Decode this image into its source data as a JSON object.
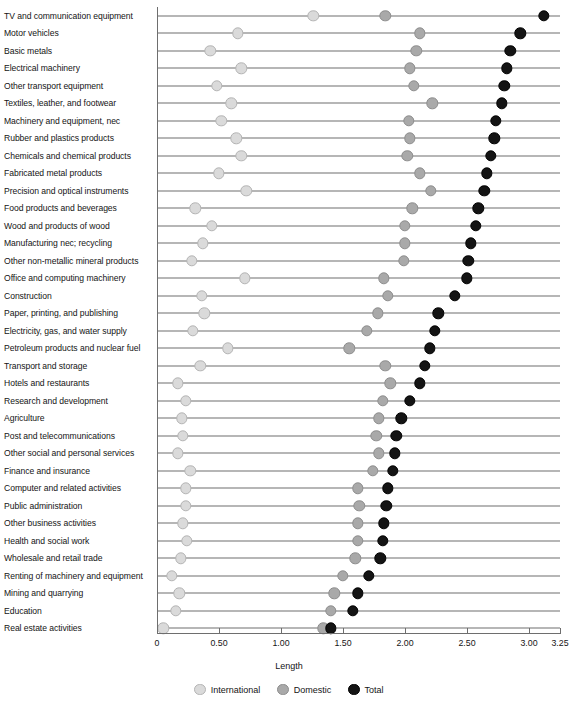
{
  "chart_data": {
    "type": "scatter",
    "title": "",
    "xlabel": "Length",
    "ylabel": "",
    "xlim": [
      0,
      3.25
    ],
    "xticks": [
      0,
      0.5,
      1.0,
      1.5,
      2.0,
      2.5,
      3.0,
      3.25
    ],
    "xtick_labels": [
      "0",
      "0.50",
      "1.00",
      "1.50",
      "2.00",
      "2.50",
      "3.00",
      "3.25"
    ],
    "grid": false,
    "legend_position": "bottom",
    "legend": [
      "International",
      "Domestic",
      "Total"
    ],
    "series_colors": {
      "International": "#dadada",
      "Domestic": "#a9a9a9",
      "Total": "#141414"
    },
    "categories": [
      "TV and communication equipment",
      "Motor vehicles",
      "Basic metals",
      "Electrical machinery",
      "Other transport equipment",
      "Textiles, leather, and footwear",
      "Machinery and equipment, nec",
      "Rubber and plastics products",
      "Chemicals and chemical products",
      "Fabricated metal products",
      "Precision and optical instruments",
      "Food products and beverages",
      "Wood and products of wood",
      "Manufacturing nec; recycling",
      "Other non-metallic mineral products",
      "Office and computing machinery",
      "Construction",
      "Paper, printing, and publishing",
      "Electricity, gas, and water supply",
      "Petroleum products and nuclear fuel",
      "Transport and storage",
      "Hotels and restaurants",
      "Research and development",
      "Agriculture",
      "Post and telecommunications",
      "Other social and personal services",
      "Finance and insurance",
      "Computer and related activities",
      "Public administration",
      "Other business activities",
      "Health and social work",
      "Wholesale and retail trade",
      "Renting of machinery and equipment",
      "Mining and quarrying",
      "Education",
      "Real estate activities"
    ],
    "series": [
      {
        "name": "International",
        "values": [
          1.26,
          0.65,
          0.43,
          0.68,
          0.48,
          0.6,
          0.52,
          0.64,
          0.68,
          0.5,
          0.72,
          0.31,
          0.44,
          0.37,
          0.28,
          0.71,
          0.36,
          0.38,
          0.29,
          0.57,
          0.35,
          0.17,
          0.23,
          0.2,
          0.21,
          0.17,
          0.27,
          0.23,
          0.23,
          0.21,
          0.24,
          0.19,
          0.12,
          0.18,
          0.15,
          0.05
        ]
      },
      {
        "name": "Domestic",
        "values": [
          1.84,
          2.12,
          2.09,
          2.04,
          2.07,
          2.22,
          2.03,
          2.04,
          2.02,
          2.12,
          2.21,
          2.06,
          2.0,
          2.0,
          1.99,
          1.83,
          1.86,
          1.78,
          1.69,
          1.55,
          1.84,
          1.88,
          1.82,
          1.79,
          1.77,
          1.79,
          1.74,
          1.62,
          1.63,
          1.62,
          1.62,
          1.6,
          1.5,
          1.43,
          1.4,
          1.34
        ]
      },
      {
        "name": "Total",
        "values": [
          3.12,
          2.93,
          2.85,
          2.82,
          2.8,
          2.78,
          2.73,
          2.72,
          2.69,
          2.66,
          2.64,
          2.59,
          2.57,
          2.53,
          2.51,
          2.5,
          2.4,
          2.27,
          2.24,
          2.2,
          2.16,
          2.12,
          2.04,
          1.97,
          1.93,
          1.92,
          1.9,
          1.86,
          1.85,
          1.83,
          1.82,
          1.8,
          1.71,
          1.62,
          1.58,
          1.4
        ]
      }
    ]
  },
  "legend": {
    "international": "International",
    "domestic": "Domestic",
    "total": "Total"
  }
}
